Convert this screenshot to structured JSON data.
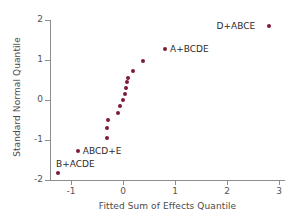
{
  "chart_data": {
    "type": "scatter",
    "title": "",
    "xlabel": "Fitted Sum of Effects Quantile",
    "ylabel": "Standard Normal Quantile",
    "xlim": [
      -1.45,
      3.05
    ],
    "ylim": [
      -2.0,
      2.0
    ],
    "xticks": [
      -1,
      0,
      1,
      2,
      3
    ],
    "xticklabels": [
      "-1",
      "0",
      "1",
      "2",
      "3"
    ],
    "yticks": [
      -2,
      -1,
      0,
      1,
      2
    ],
    "yticklabels": [
      "-2",
      "-1",
      "0",
      "1",
      "2"
    ],
    "grid": false,
    "legend": "none",
    "marker_color": "#7d1a3d",
    "axis_color": "#8c8c8c",
    "points": [
      {
        "x": -1.25,
        "y": -1.83,
        "label": "B+ACDE",
        "label_pos": "above-right"
      },
      {
        "x": -0.87,
        "y": -1.28,
        "label": "ABCD+E",
        "label_pos": "right"
      },
      {
        "x": -0.3,
        "y": -0.96,
        "label": "",
        "label_pos": ""
      },
      {
        "x": -0.31,
        "y": -0.71,
        "label": "",
        "label_pos": ""
      },
      {
        "x": -0.29,
        "y": -0.5,
        "label": "",
        "label_pos": ""
      },
      {
        "x": -0.1,
        "y": -0.32,
        "label": "",
        "label_pos": ""
      },
      {
        "x": -0.05,
        "y": -0.15,
        "label": "",
        "label_pos": ""
      },
      {
        "x": 0.0,
        "y": 0.0,
        "label": "",
        "label_pos": ""
      },
      {
        "x": 0.03,
        "y": 0.15,
        "label": "",
        "label_pos": ""
      },
      {
        "x": 0.06,
        "y": 0.3,
        "label": "",
        "label_pos": ""
      },
      {
        "x": 0.08,
        "y": 0.45,
        "label": "",
        "label_pos": ""
      },
      {
        "x": 0.1,
        "y": 0.54,
        "label": "",
        "label_pos": ""
      },
      {
        "x": 0.19,
        "y": 0.73,
        "label": "",
        "label_pos": ""
      },
      {
        "x": 0.38,
        "y": 0.98,
        "label": "",
        "label_pos": ""
      },
      {
        "x": 0.81,
        "y": 1.28,
        "label": "A+BCDE",
        "label_pos": "right"
      },
      {
        "x": 2.8,
        "y": 1.84,
        "label": "D+ABCE",
        "label_pos": "left"
      }
    ]
  }
}
